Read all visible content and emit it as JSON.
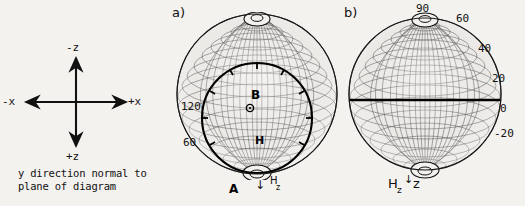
{
  "figure": {
    "background_color": "#f4f2ee",
    "ink_color": "#111111"
  },
  "axis_legend": {
    "name": "coordinate-axes-legend",
    "up_label": "-z",
    "down_label": "+z",
    "left_label": "-x",
    "right_label": "+x",
    "caption_line1": "y direction normal to",
    "caption_line2": "plane of diagram"
  },
  "panel_a": {
    "tag": "a)",
    "labels": {
      "point_b": "B",
      "point_a": "A",
      "center_marker": "⊙",
      "center_field": "H",
      "field_arrow_label": "H",
      "field_arrow_sub": "z",
      "arrow_glyph": "↓"
    },
    "angle_ticks": [
      "120",
      "60"
    ],
    "description": "stereographic mesh sphere with bold inner circle through A and B"
  },
  "panel_b": {
    "tag": "b)",
    "labels": {
      "bottom_field": "H",
      "bottom_field_sub": "z",
      "bottom_axis": "z",
      "arrow_glyph": "↓"
    },
    "angle_ticks": [
      {
        "value": "90"
      },
      {
        "value": "60"
      },
      {
        "value": "40"
      },
      {
        "value": "20"
      },
      {
        "value": "0"
      },
      {
        "value": "-20"
      }
    ],
    "description": "stereographic mesh sphere with bold horizontal equator line"
  }
}
